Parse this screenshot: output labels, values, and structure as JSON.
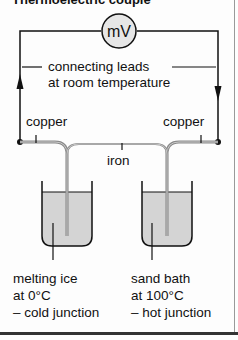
{
  "title": "Thermoelectric couple",
  "meter": {
    "label": "mV"
  },
  "labels": {
    "leads_line1": "connecting leads",
    "leads_line2": "at room temperature",
    "copper_left": "copper",
    "copper_right": "copper",
    "iron": "iron"
  },
  "cold_junction": {
    "line1": "melting ice",
    "line2": "at 0°C",
    "line3": "– cold junction"
  },
  "hot_junction": {
    "line1": "sand bath",
    "line2": "at 100°C",
    "line3": "– hot junction"
  },
  "colors": {
    "wire": "#111111",
    "pipe": "#9a9a9a",
    "fluid": "#d4d4d4",
    "meter_fill": "#e6e6e6"
  }
}
